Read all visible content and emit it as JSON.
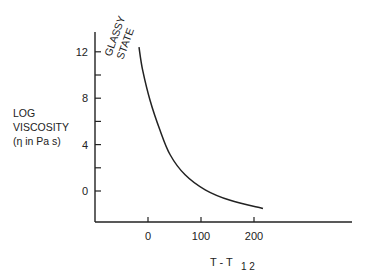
{
  "chart_data": {
    "type": "line",
    "title": "",
    "xlabel": "T - T",
    "xlabel_subscript": "1 2",
    "ylabel_lines": [
      "LOG",
      "VISCOSITY",
      "(η in Pa s)"
    ],
    "annotation_lines": [
      "GLASSY",
      "STATE"
    ],
    "xticks": [
      0,
      100,
      200
    ],
    "yticks": [
      0,
      4,
      8,
      12
    ],
    "yminor_ticks": [
      2,
      6,
      10
    ],
    "xlim": [
      -100,
      380
    ],
    "ylim": [
      -2.7,
      13.7
    ],
    "grid": false,
    "legend": null,
    "series": [
      {
        "name": "viscosity",
        "x": [
          -17,
          -10,
          4,
          23,
          42,
          70,
          108,
          155,
          217
        ],
        "y": [
          12.4,
          10.4,
          7.8,
          5.2,
          3.1,
          1.4,
          0.1,
          -0.8,
          -1.5
        ]
      }
    ]
  }
}
